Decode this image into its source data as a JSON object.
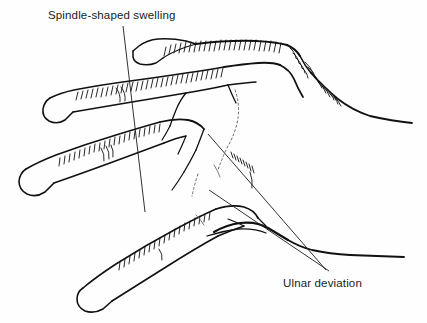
{
  "figure": {
    "kind": "medical-line-drawing",
    "background_color": "#fefefe",
    "ink_color": "#111111",
    "width": 427,
    "height": 323
  },
  "annotations": [
    {
      "id": "spindle",
      "label": "Spindle-shaped swelling",
      "text_x": 48,
      "text_y": 9,
      "leader": {
        "x1": 123,
        "y1": 26,
        "x2": 145,
        "y2": 212
      }
    },
    {
      "id": "ulnar",
      "label": "Ulnar deviation",
      "text_x": 283,
      "text_y": 277,
      "leaders": [
        {
          "x1": 208,
          "y1": 134,
          "x2": 326,
          "y2": 270
        },
        {
          "x1": 209,
          "y1": 190,
          "x2": 329,
          "y2": 271
        }
      ]
    }
  ]
}
